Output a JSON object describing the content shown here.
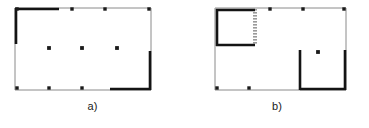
{
  "figure": {
    "type": "floor-plan-diagram",
    "background_color": "#ffffff",
    "thin_wall_color": "#8a8a8a",
    "thick_wall_color": "#141414",
    "marker_color": "#1a1a1a",
    "hatch_color": "#9a9a9a",
    "panels": [
      {
        "id": "a",
        "caption": "a)",
        "description": "rectangular room outline with thick wall segments at upper-left and lower-right and three interior point markers",
        "outline": {
          "x": 15,
          "y": 8,
          "width": 136,
          "height": 82
        },
        "thin_walls": [
          {
            "name": "top-wall",
            "x1": 15,
            "y1": 8,
            "x2": 151,
            "y2": 8
          },
          {
            "name": "right-wall",
            "x1": 151,
            "y1": 8,
            "x2": 151,
            "y2": 90
          },
          {
            "name": "bottom-wall",
            "x1": 15,
            "y1": 90,
            "x2": 151,
            "y2": 90
          },
          {
            "name": "left-wall",
            "x1": 15,
            "y1": 8,
            "x2": 15,
            "y2": 90
          }
        ],
        "thick_walls": [
          {
            "name": "thick-top-left-horizontal",
            "x1": 15,
            "y1": 9,
            "x2": 59,
            "y2": 9
          },
          {
            "name": "thick-left-vertical",
            "x1": 16,
            "y1": 8,
            "x2": 16,
            "y2": 44
          },
          {
            "name": "thick-right-vertical",
            "x1": 150,
            "y1": 51,
            "x2": 150,
            "y2": 90
          },
          {
            "name": "thick-bottom-right-horizontal",
            "x1": 110,
            "y1": 89,
            "x2": 151,
            "y2": 89
          }
        ],
        "corner_markers": [
          {
            "name": "marker-top-left",
            "x": 17,
            "y": 9
          },
          {
            "name": "marker-top-mid-1",
            "x": 72,
            "y": 9
          },
          {
            "name": "marker-top-mid-2",
            "x": 105,
            "y": 9
          },
          {
            "name": "marker-top-right",
            "x": 149,
            "y": 9
          },
          {
            "name": "marker-bottom-left",
            "x": 17,
            "y": 88
          },
          {
            "name": "marker-bottom-mid-1",
            "x": 49,
            "y": 88
          },
          {
            "name": "marker-bottom-mid-2",
            "x": 82,
            "y": 88
          }
        ],
        "interior_markers": [
          {
            "name": "interior-point-1",
            "x": 49,
            "y": 48
          },
          {
            "name": "interior-point-2",
            "x": 82,
            "y": 48
          },
          {
            "name": "interior-point-3",
            "x": 117,
            "y": 48
          }
        ],
        "interior_marker_count": 3
      },
      {
        "id": "b",
        "caption": "b)",
        "description": "rectangular room outline containing a small enclosed room at the upper-left with a hatched right wall, a U-shaped thick wall enclosure at lower-right and one interior point marker",
        "outline": {
          "x": 30,
          "y": 8,
          "width": 131,
          "height": 82
        },
        "thin_walls": [
          {
            "name": "top-wall",
            "x1": 30,
            "y1": 8,
            "x2": 161,
            "y2": 8
          },
          {
            "name": "right-wall",
            "x1": 161,
            "y1": 8,
            "x2": 161,
            "y2": 90
          },
          {
            "name": "bottom-wall",
            "x1": 30,
            "y1": 90,
            "x2": 161,
            "y2": 90
          },
          {
            "name": "left-wall",
            "x1": 30,
            "y1": 8,
            "x2": 30,
            "y2": 90
          }
        ],
        "inner_room": {
          "name": "inner-room",
          "x": 31,
          "y": 9,
          "width": 39,
          "height": 37,
          "thick_walls": [
            {
              "name": "inner-room-top-wall",
              "x1": 31,
              "y1": 10,
              "x2": 70,
              "y2": 10
            },
            {
              "name": "inner-room-left-wall",
              "x1": 32,
              "y1": 9,
              "x2": 32,
              "y2": 46
            },
            {
              "name": "inner-room-bottom-wall",
              "x1": 31,
              "y1": 45,
              "x2": 70,
              "y2": 45
            }
          ],
          "hatched_wall": {
            "name": "inner-room-right-wall-hatched",
            "x": 68,
            "y": 9,
            "width": 4,
            "height": 37,
            "pattern": "dotted"
          }
        },
        "thick_walls": [
          {
            "name": "u-enclosure-left-vertical",
            "x1": 115,
            "y1": 50,
            "x2": 115,
            "y2": 90
          },
          {
            "name": "u-enclosure-bottom-horizontal",
            "x1": 115,
            "y1": 89,
            "x2": 161,
            "y2": 89
          },
          {
            "name": "u-enclosure-right-vertical",
            "x1": 160,
            "y1": 50,
            "x2": 160,
            "y2": 90
          }
        ],
        "corner_markers": [
          {
            "name": "marker-top-mid-1",
            "x": 85,
            "y": 9
          },
          {
            "name": "marker-top-mid-2",
            "x": 118,
            "y": 9
          },
          {
            "name": "marker-top-right",
            "x": 159,
            "y": 9
          },
          {
            "name": "marker-bottom-left",
            "x": 32,
            "y": 88
          },
          {
            "name": "marker-bottom-mid",
            "x": 64,
            "y": 88
          }
        ],
        "interior_markers": [
          {
            "name": "interior-point-1",
            "x": 133,
            "y": 52
          }
        ],
        "interior_marker_count": 1
      }
    ]
  }
}
